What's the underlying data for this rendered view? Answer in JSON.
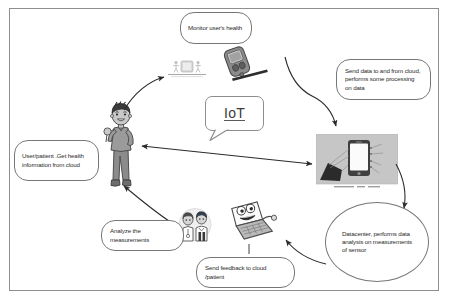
{
  "diagram": {
    "title_word": "IoT",
    "frame_color": "#8e8e8e",
    "text_color": "#2b2b2b",
    "callouts": [
      {
        "id": "monitor",
        "text": "Monitor user's health"
      },
      {
        "id": "send_cloud",
        "text": "Send data to and from cloud, performs some processing on data"
      },
      {
        "id": "user_get",
        "text": "User/patient .Get health information from cloud"
      },
      {
        "id": "analyze",
        "text": "Analyze the measurements"
      },
      {
        "id": "feedback",
        "text": "Send feedback to cloud /patient"
      },
      {
        "id": "datacenter",
        "text": "Datacenter, performs data analysis on measurements of sensor"
      }
    ],
    "artwork": [
      {
        "id": "person",
        "label": "user-patient-illustration"
      },
      {
        "id": "meter",
        "label": "glucose-meter-illustration"
      },
      {
        "id": "tracker",
        "label": "activity-tracker-icon"
      },
      {
        "id": "phone",
        "label": "smartphone-cloud-photo"
      },
      {
        "id": "doctors",
        "label": "doctors-illustration"
      },
      {
        "id": "laptop",
        "label": "laptop-character-illustration"
      }
    ]
  }
}
